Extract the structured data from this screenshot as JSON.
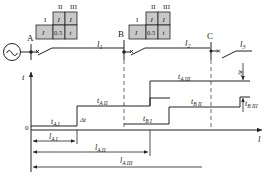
{
  "colors": {
    "line": "#222222",
    "box_fill": "#c8c8c8",
    "background": "#ffffff",
    "dashed": "#444444"
  },
  "buses": [
    {
      "label": "A"
    },
    {
      "label": "B"
    },
    {
      "label": "C"
    }
  ],
  "source": {
    "icon": "ac-source-icon",
    "glyph": "~"
  },
  "line_sections": [
    {
      "label": "l",
      "sub": "1"
    },
    {
      "label": "l",
      "sub": "2"
    },
    {
      "label": "l",
      "sub": "3"
    }
  ],
  "relay_tables": [
    {
      "name": "relay-A",
      "headers": [
        "I",
        "II",
        "III"
      ],
      "top_row": [
        "I",
        "I"
      ],
      "bottom_row": [
        "I",
        "0.5",
        "t"
      ]
    },
    {
      "name": "relay-B",
      "headers": [
        "I",
        "II",
        "III"
      ],
      "top_row": [
        "I",
        "I"
      ],
      "bottom_row": [
        "I",
        "0.5",
        "t"
      ]
    }
  ],
  "axes": {
    "y_label": "t",
    "x_label": "l",
    "origin": "0"
  },
  "time_labels": {
    "tA1": {
      "main": "t",
      "sub": "A I"
    },
    "tA2": {
      "main": "t",
      "sub": "A II"
    },
    "tA3": {
      "main": "t",
      "sub": "A III"
    },
    "tB1": {
      "main": "t",
      "sub": "B I"
    },
    "tB2": {
      "main": "t",
      "sub": "B II"
    },
    "tB3": {
      "main": "t",
      "sub": "B III"
    },
    "delta_t_1": "Δt",
    "delta_t_2": "Δt"
  },
  "reach_labels": {
    "lA1": {
      "main": "l",
      "sub": "A I"
    },
    "lA2": {
      "main": "l",
      "sub": "A II"
    },
    "lA3": {
      "main": "l",
      "sub": "A III"
    }
  }
}
